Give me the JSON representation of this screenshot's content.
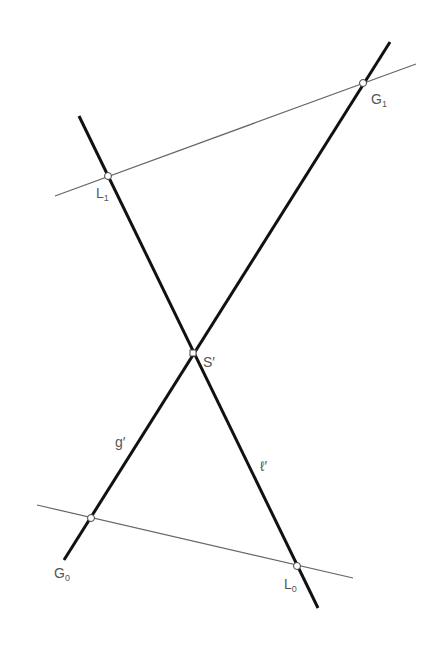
{
  "diagram": {
    "colors": {
      "heavy_line": "#111111",
      "thin_line": "#666666",
      "label": "#555555",
      "point_fill": "#ffffff"
    },
    "heavy_lines": [
      {
        "name": "g-prime",
        "label": "g′",
        "x1": 390,
        "y1": 42,
        "x2": 64,
        "y2": 560
      },
      {
        "name": "l-prime",
        "label": "ℓ′",
        "x1": 79,
        "y1": 116,
        "x2": 318,
        "y2": 608
      }
    ],
    "thin_lines": [
      {
        "name": "line-L1-G1",
        "x1": 55,
        "y1": 196,
        "x2": 416,
        "y2": 64
      },
      {
        "name": "line-G0-L0",
        "x1": 37,
        "y1": 505,
        "x2": 353,
        "y2": 578
      }
    ],
    "points": {
      "G1": {
        "x": 363,
        "y": 83
      },
      "L1": {
        "x": 108,
        "y": 176
      },
      "S": {
        "x": 193,
        "y": 353
      },
      "G0": {
        "x": 91,
        "y": 518
      },
      "L0": {
        "x": 297,
        "y": 566
      }
    },
    "labels": {
      "G1": {
        "main": "G",
        "sub": "1"
      },
      "L1": {
        "main": "L",
        "sub": "1"
      },
      "S": {
        "main": "S′"
      },
      "G0": {
        "main": "G",
        "sub": "0"
      },
      "L0": {
        "main": "L",
        "sub": "0"
      },
      "g": {
        "main": "g′"
      },
      "l": {
        "main": "ℓ′"
      }
    }
  }
}
